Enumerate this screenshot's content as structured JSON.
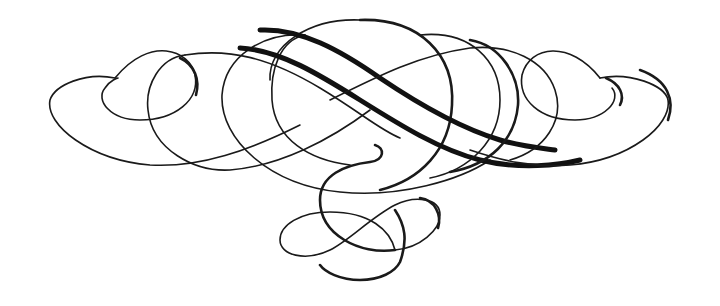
{
  "artwork": {
    "type": "calligraphic-flourish",
    "description": "Symmetric ornamental scroll flourish with interlacing loops and swashes",
    "ink_color": "#1a1a1a",
    "background_color": "#ffffff"
  }
}
